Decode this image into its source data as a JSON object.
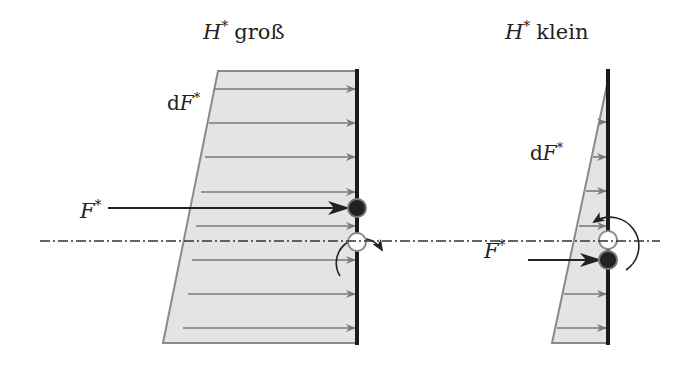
{
  "left_panel": {
    "title_var": "H",
    "title_sup": "*",
    "title_word": "groß",
    "df_label_d": "d",
    "df_label_var": "F",
    "df_label_sup": "*",
    "f_label_var": "F",
    "f_label_sup": "*"
  },
  "right_panel": {
    "title_var": "H",
    "title_sup": "*",
    "title_word": "klein",
    "df_label_d": "d",
    "df_label_var": "F",
    "df_label_sup": "*",
    "f_label_var": "F",
    "f_label_sup": "*"
  },
  "colors": {
    "fill": "#e4e4e4",
    "outline": "#8a8a8a",
    "arrow_gray": "#7a7a7a",
    "bar": "#1a1a1a",
    "dark": "#222222"
  }
}
